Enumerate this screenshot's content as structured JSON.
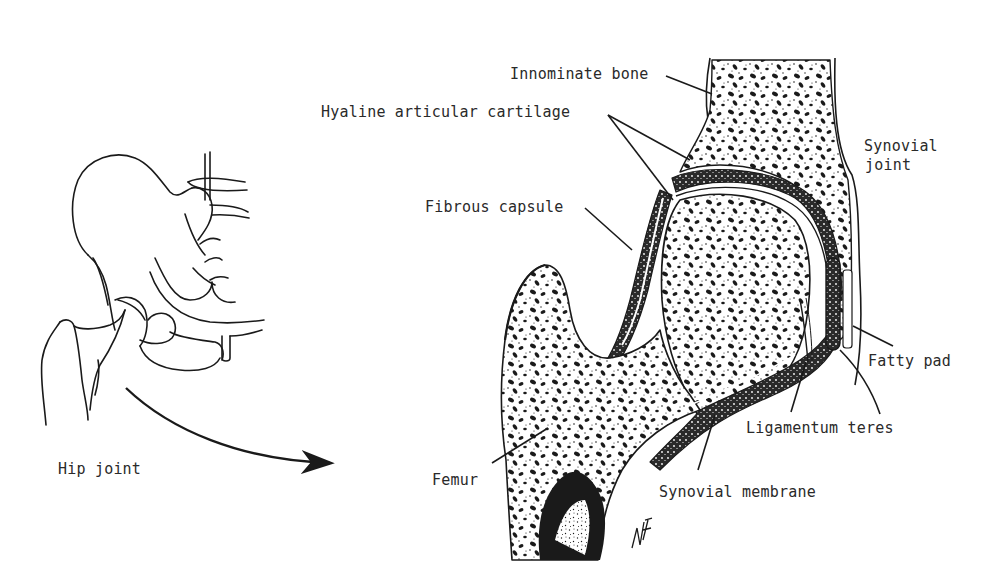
{
  "figure": {
    "overview": {
      "caption": "Hip joint"
    },
    "cross_section": {
      "labels": {
        "innominate_bone": "Innominate bone",
        "hyaline_cartilage": "Hyaline articular cartilage",
        "synovial_joint_line1": "Synovial",
        "synovial_joint_line2": "joint",
        "fibrous_capsule": "Fibrous capsule",
        "fatty_pad": "Fatty pad",
        "ligamentum_teres": "Ligamentum teres",
        "femur": "Femur",
        "synovial_membrane": "Synovial membrane"
      },
      "signature": "MF"
    },
    "colors": {
      "ink": "#1a1a1a",
      "text": "#2a2a2a",
      "background": "#ffffff"
    }
  }
}
